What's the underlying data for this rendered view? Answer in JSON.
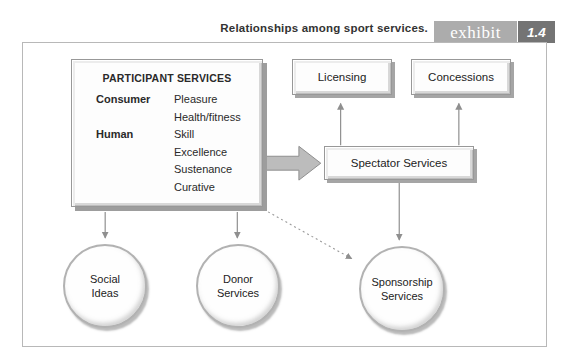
{
  "header": {
    "caption": "Relationships among sport services.",
    "exhibit_label": "exhibit",
    "exhibit_number": "1.4"
  },
  "participant_box": {
    "title": "PARTICIPANT SERVICES",
    "groups": [
      {
        "label": "Consumer",
        "items": [
          "Pleasure",
          "Health/fitness"
        ]
      },
      {
        "label": "Human",
        "items": [
          "Skill",
          "Excellence",
          "Sustenance",
          "Curative"
        ]
      }
    ]
  },
  "boxes": {
    "licensing": "Licensing",
    "concessions": "Concessions",
    "spectator": "Spectator Services"
  },
  "circles": [
    {
      "line1": "Social",
      "line2": "Ideas"
    },
    {
      "line1": "Donor",
      "line2": "Services"
    },
    {
      "line1": "Sponsorship",
      "line2": "Services"
    }
  ],
  "colors": {
    "badge_exhibit_bg": "#acacac",
    "badge_number_bg": "#747474",
    "frame_border": "#b8b8b8",
    "arrow_gray": "#8f8f8f",
    "block_arrow_fill": "#bcbcbc",
    "box_shadow_gray": "#a5a5a5",
    "text": "#2a2a2a"
  }
}
